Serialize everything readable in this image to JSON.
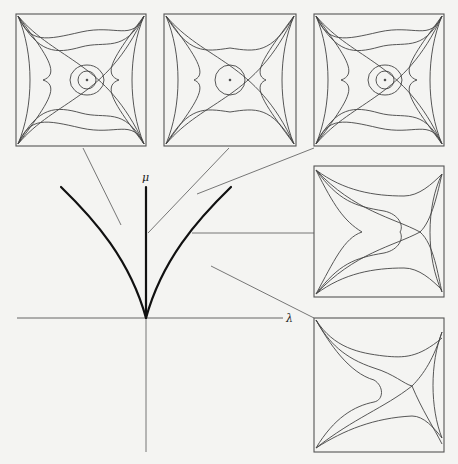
{
  "diagram": {
    "type": "bifurcation diagram with phase portrait insets",
    "axes": {
      "x_label": "λ",
      "y_label": "μ"
    },
    "curves": [
      {
        "name": "left-bifurcation-curve",
        "style": "thick"
      },
      {
        "name": "mu-axis-curve",
        "style": "thick"
      },
      {
        "name": "right-bifurcation-curve",
        "style": "thick"
      }
    ],
    "insets": [
      {
        "id": "portrait-1",
        "description": "center with two nested orbits, two saddles, heteroclinic eye"
      },
      {
        "id": "portrait-2",
        "description": "center with one orbit, two saddles, symmetric eye"
      },
      {
        "id": "portrait-3",
        "description": "center with two nested orbits, two saddles, heteroclinic eye"
      },
      {
        "id": "portrait-4",
        "description": "cusp point on left, single saddle on right"
      },
      {
        "id": "portrait-5",
        "description": "single saddle, no equilibrium center"
      }
    ],
    "colors": {
      "background": "#f4f4f2",
      "ink": "#333333",
      "thick_ink": "#111111"
    }
  }
}
